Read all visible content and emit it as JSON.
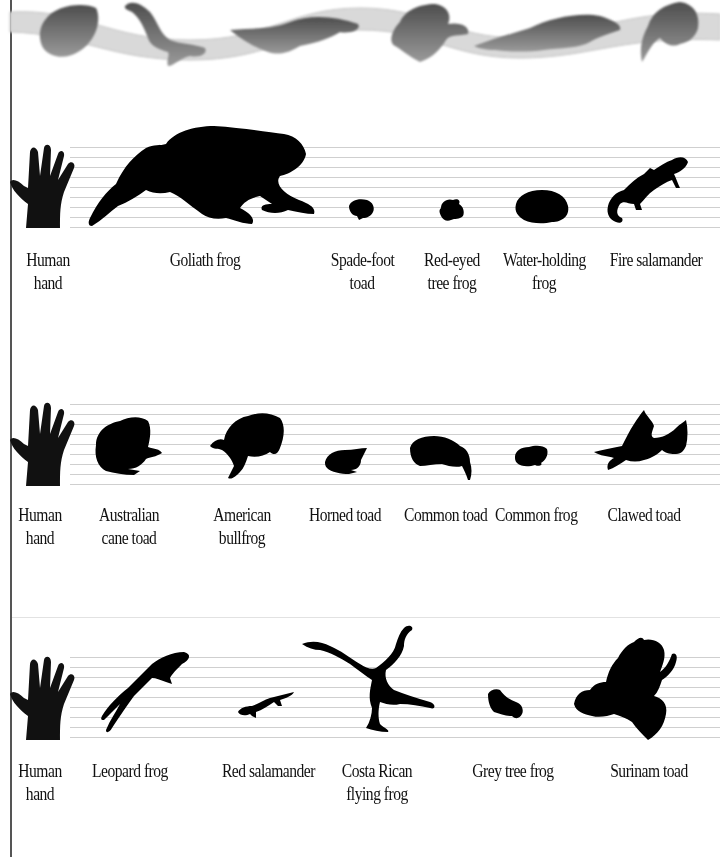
{
  "banner": {
    "description": "Wavy grey ribbon with six grey amphibian silhouettes",
    "ribbon_color": "#d6d6d6",
    "silhouette_color": "#6a6a6a",
    "animals": [
      "toad-icon",
      "salamander-icon",
      "newt-icon",
      "tree-frog-icon",
      "crested-newt-icon",
      "frog-icon"
    ]
  },
  "colors": {
    "silhouette": "#000000",
    "guide_line": "#cfcfcf",
    "left_rule": "#555555",
    "background": "#ffffff"
  },
  "rows": [
    {
      "items": [
        {
          "icon": "human-hand-icon",
          "label_line1": "Human",
          "label_line2": "hand"
        },
        {
          "icon": "goliath-frog-icon",
          "label_line1": "Goliath frog",
          "label_line2": ""
        },
        {
          "icon": "spade-foot-toad-icon",
          "label_line1": "Spade-foot",
          "label_line2": "toad"
        },
        {
          "icon": "red-eyed-tree-frog-icon",
          "label_line1": "Red-eyed",
          "label_line2": "tree frog"
        },
        {
          "icon": "water-holding-frog-icon",
          "label_line1": "Water-holding",
          "label_line2": "frog"
        },
        {
          "icon": "fire-salamander-icon",
          "label_line1": "Fire salamander",
          "label_line2": ""
        }
      ]
    },
    {
      "items": [
        {
          "icon": "human-hand-icon",
          "label_line1": "Human",
          "label_line2": "hand"
        },
        {
          "icon": "australian-cane-toad-icon",
          "label_line1": "Australian",
          "label_line2": "cane toad"
        },
        {
          "icon": "american-bullfrog-icon",
          "label_line1": "American",
          "label_line2": "bullfrog"
        },
        {
          "icon": "horned-toad-icon",
          "label_line1": "Horned toad",
          "label_line2": ""
        },
        {
          "icon": "common-toad-icon",
          "label_line1": "Common toad",
          "label_line2": ""
        },
        {
          "icon": "common-frog-icon",
          "label_line1": "Common frog",
          "label_line2": ""
        },
        {
          "icon": "clawed-toad-icon",
          "label_line1": "Clawed toad",
          "label_line2": ""
        }
      ]
    },
    {
      "items": [
        {
          "icon": "human-hand-icon",
          "label_line1": "Human",
          "label_line2": "hand"
        },
        {
          "icon": "leopard-frog-icon",
          "label_line1": "Leopard frog",
          "label_line2": ""
        },
        {
          "icon": "red-salamander-icon",
          "label_line1": "Red salamander",
          "label_line2": ""
        },
        {
          "icon": "costa-rican-flying-frog-icon",
          "label_line1": "Costa Rican",
          "label_line2": "flying frog"
        },
        {
          "icon": "grey-tree-frog-icon",
          "label_line1": "Grey tree frog",
          "label_line2": ""
        },
        {
          "icon": "surinam-toad-icon",
          "label_line1": "Surinam toad",
          "label_line2": ""
        }
      ]
    }
  ]
}
